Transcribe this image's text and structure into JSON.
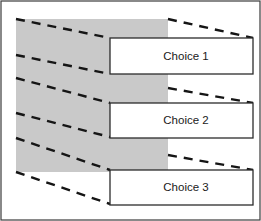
{
  "figure": {
    "name": "perspective-projection-choices-diagram",
    "width": 261,
    "height": 221,
    "background_color": "#ffffff",
    "frame": {
      "stroke_color": "#3b3b3b",
      "stroke_width": 1.2,
      "x": 1,
      "y": 1,
      "width": 259,
      "height": 219
    },
    "source_plane": {
      "name": "gray-source-rectangle",
      "fill_color": "#c9c9c9",
      "x": 16,
      "y": 19,
      "width": 152,
      "height": 153
    },
    "dash": {
      "color": "#151515",
      "width": 2.4,
      "pattern": "9 7"
    },
    "box_style": {
      "fill_color": "#ffffff",
      "stroke_color": "#2b2b2b",
      "stroke_width": 1.3
    },
    "choices": [
      {
        "label": "Choice 1",
        "x": 110,
        "y": 38,
        "width": 143,
        "height": 36,
        "label_x": 186,
        "label_y": 57
      },
      {
        "label": "Choice 2",
        "x": 110,
        "y": 103,
        "width": 143,
        "height": 35,
        "label_x": 186,
        "label_y": 121
      },
      {
        "label": "Choice 3",
        "x": 110,
        "y": 170,
        "width": 143,
        "height": 35,
        "label_x": 186,
        "label_y": 188
      }
    ],
    "projection_lines": [
      {
        "name": "choice-1-top-left-ray",
        "x1": 16,
        "y1": 19,
        "x2": 110,
        "y2": 38
      },
      {
        "name": "choice-1-top-right-ray",
        "x1": 168,
        "y1": 19,
        "x2": 253,
        "y2": 38
      },
      {
        "name": "choice-1-bottom-left-ray",
        "x1": 16,
        "y1": 55,
        "x2": 110,
        "y2": 74
      },
      {
        "name": "choice-2-top-left-ray",
        "x1": 16,
        "y1": 78,
        "x2": 110,
        "y2": 103
      },
      {
        "name": "choice-2-top-right-ray",
        "x1": 168,
        "y1": 88,
        "x2": 253,
        "y2": 103
      },
      {
        "name": "choice-2-bottom-left-ray",
        "x1": 16,
        "y1": 113,
        "x2": 110,
        "y2": 137
      },
      {
        "name": "choice-3-top-left-ray",
        "x1": 16,
        "y1": 138,
        "x2": 110,
        "y2": 170
      },
      {
        "name": "choice-3-top-right-ray",
        "x1": 168,
        "y1": 155,
        "x2": 253,
        "y2": 170
      },
      {
        "name": "choice-3-bottom-left-ray",
        "x1": 16,
        "y1": 172,
        "x2": 110,
        "y2": 204
      }
    ]
  }
}
